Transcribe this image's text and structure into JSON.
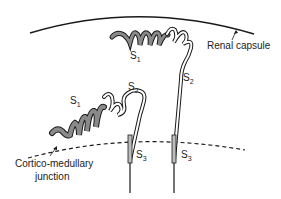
{
  "diagram": {
    "type": "anatomical schematic",
    "labels": {
      "renal_capsule": "Renal capsule",
      "cortico_medullary_1": "Cortico-medullary",
      "cortico_medullary_2": "junction",
      "superficial": {
        "s1": "S",
        "s1_sub": "1",
        "s2": "S",
        "s2_sub": "2",
        "s3": "S",
        "s3_sub": "3"
      },
      "juxtamedullary": {
        "s1": "S",
        "s1_sub": "1",
        "s2": "S",
        "s2_sub": "2",
        "s3": "S",
        "s3_sub": "3"
      }
    },
    "colors": {
      "line": "#1a1a1a",
      "s1_fill": "#8a8a8a",
      "tubule_fill": "#ffffff"
    }
  }
}
